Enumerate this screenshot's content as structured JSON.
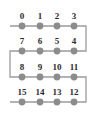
{
  "figure": {
    "name": "boustrophedon-node-order-diagram",
    "background_color": "#ffffff",
    "node_color": "#8c8c8c",
    "path_color": "#9a9a9a",
    "label_color": "#2b2b2b",
    "node_radius": 3.4,
    "path_width": 1.3,
    "rows": 4,
    "columns": 4
  },
  "chart_data": {
    "type": "scatter",
    "title": "",
    "xlabel": "",
    "ylabel": "",
    "grid": false,
    "legend": null,
    "xlim": [
      0,
      102
    ],
    "ylim": [
      0,
      123
    ],
    "columns_x": [
      22,
      40,
      57,
      74
    ],
    "rows_y": [
      26,
      51,
      77,
      102
    ],
    "label_offset_y": -7,
    "nodes": [
      {
        "label": "0",
        "value": 0,
        "row": 0,
        "col": 0,
        "x": 22,
        "y": 26
      },
      {
        "label": "1",
        "value": 1,
        "row": 0,
        "col": 1,
        "x": 40,
        "y": 26
      },
      {
        "label": "2",
        "value": 2,
        "row": 0,
        "col": 2,
        "x": 57,
        "y": 26
      },
      {
        "label": "3",
        "value": 3,
        "row": 0,
        "col": 3,
        "x": 74,
        "y": 26
      },
      {
        "label": "4",
        "value": 4,
        "row": 1,
        "col": 3,
        "x": 74,
        "y": 51
      },
      {
        "label": "5",
        "value": 5,
        "row": 1,
        "col": 2,
        "x": 57,
        "y": 51
      },
      {
        "label": "6",
        "value": 6,
        "row": 1,
        "col": 1,
        "x": 40,
        "y": 51
      },
      {
        "label": "7",
        "value": 7,
        "row": 1,
        "col": 0,
        "x": 22,
        "y": 51
      },
      {
        "label": "8",
        "value": 8,
        "row": 2,
        "col": 0,
        "x": 22,
        "y": 77
      },
      {
        "label": "9",
        "value": 9,
        "row": 2,
        "col": 1,
        "x": 40,
        "y": 77
      },
      {
        "label": "10",
        "value": 10,
        "row": 2,
        "col": 2,
        "x": 57,
        "y": 77
      },
      {
        "label": "11",
        "value": 11,
        "row": 2,
        "col": 3,
        "x": 74,
        "y": 77
      },
      {
        "label": "12",
        "value": 12,
        "row": 3,
        "col": 3,
        "x": 74,
        "y": 102
      },
      {
        "label": "13",
        "value": 13,
        "row": 3,
        "col": 2,
        "x": 57,
        "y": 102
      },
      {
        "label": "14",
        "value": 14,
        "row": 3,
        "col": 1,
        "x": 40,
        "y": 102
      },
      {
        "label": "15",
        "value": 15,
        "row": 3,
        "col": 0,
        "x": 22,
        "y": 102
      }
    ],
    "path_points": [
      {
        "x": 10,
        "y": 26
      },
      {
        "x": 86,
        "y": 26
      },
      {
        "x": 86,
        "y": 51
      },
      {
        "x": 10,
        "y": 51
      },
      {
        "x": 10,
        "y": 77
      },
      {
        "x": 86,
        "y": 77
      },
      {
        "x": 86,
        "y": 102
      },
      {
        "x": 10,
        "y": 102
      }
    ],
    "row_labels": [
      {
        "row": 0,
        "labels": [
          "0",
          "1",
          "2",
          "3"
        ]
      },
      {
        "row": 1,
        "labels": [
          "7",
          "6",
          "5",
          "4"
        ]
      },
      {
        "row": 2,
        "labels": [
          "8",
          "9",
          "10",
          "11"
        ]
      },
      {
        "row": 3,
        "labels": [
          "15",
          "14",
          "13",
          "12"
        ]
      }
    ]
  }
}
